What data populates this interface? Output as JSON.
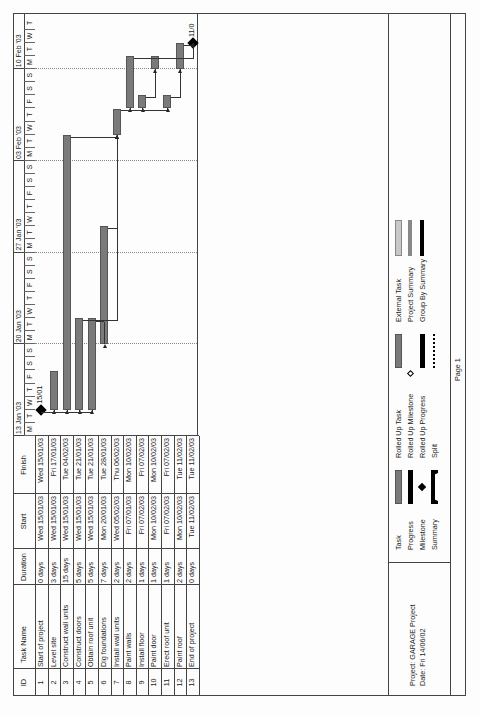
{
  "table": {
    "headers": {
      "id": "ID",
      "task_name": "Task Name",
      "duration": "Duration",
      "start": "Start",
      "finish": "Finish"
    },
    "rows": [
      {
        "id": "1",
        "name": "Start of project",
        "duration": "0 days",
        "start": "Wed 15/01/03",
        "finish": "Wed 15/01/03"
      },
      {
        "id": "2",
        "name": "Level site",
        "duration": "3 days",
        "start": "Wed 15/01/03",
        "finish": "Fri 17/01/03"
      },
      {
        "id": "3",
        "name": "Construct wall units",
        "duration": "15 days",
        "start": "Wed 15/01/03",
        "finish": "Tue 04/02/03"
      },
      {
        "id": "4",
        "name": "Construct doors",
        "duration": "5 days",
        "start": "Wed 15/01/03",
        "finish": "Tue 21/01/03"
      },
      {
        "id": "5",
        "name": "Obtain roof unit",
        "duration": "5 days",
        "start": "Wed 15/01/03",
        "finish": "Tue 21/01/03"
      },
      {
        "id": "6",
        "name": "Dig foundations",
        "duration": "7 days",
        "start": "Mon 20/01/03",
        "finish": "Tue 28/01/03"
      },
      {
        "id": "7",
        "name": "Install wall units",
        "duration": "2 days",
        "start": "Wed 05/02/03",
        "finish": "Thu 06/02/03"
      },
      {
        "id": "8",
        "name": "Paint walls",
        "duration": "2 days",
        "start": "Fri 07/01/03",
        "finish": "Mon 10/02/03"
      },
      {
        "id": "9",
        "name": "Install floor",
        "duration": "1 days",
        "start": "Fri 07/02/03",
        "finish": "Fri 07/02/03"
      },
      {
        "id": "10",
        "name": "Paint door",
        "duration": "1 days",
        "start": "Mon 10/02/03",
        "finish": "Mon 10/02/03"
      },
      {
        "id": "11",
        "name": "Erect roof unit",
        "duration": "1 days",
        "start": "Fri 07/02/03",
        "finish": "Fri 07/02/03"
      },
      {
        "id": "12",
        "name": "Paint roof",
        "duration": "2 days",
        "start": "Mon 10/02/03",
        "finish": "Tue 11/02/03"
      },
      {
        "id": "13",
        "name": "End of project",
        "duration": "0 days",
        "start": "Tue 11/02/03",
        "finish": "Tue 11/02/03"
      }
    ]
  },
  "timeline": {
    "weeks": [
      "13 Jan '03",
      "20 Jan '03",
      "27 Jan '03",
      "03 Feb '03",
      "10 Feb '03"
    ],
    "days": [
      "M",
      "T",
      "W",
      "T",
      "F",
      "S",
      "S",
      "M",
      "T",
      "W",
      "T",
      "F",
      "S",
      "S",
      "M",
      "T",
      "W",
      "T",
      "F",
      "S",
      "S",
      "M",
      "T",
      "W",
      "T",
      "F",
      "S",
      "S",
      "M",
      "T",
      "W",
      "T"
    ],
    "milestone_labels": {
      "start": "15/01",
      "end": "11/0"
    }
  },
  "legend": {
    "project": "Project: GARAGE Project",
    "date": "Date: Fri 14/06/02",
    "items": {
      "task": "Task",
      "progress": "Progress",
      "milestone": "Milestone",
      "summary": "Summary",
      "rolled_up_task": "Rolled Up Task",
      "rolled_up_milestone": "Rolled Up Milestone",
      "rolled_up_progress": "Rolled Up Progress",
      "split": "Split",
      "external_task": "External Task",
      "project_summary": "Project Summary",
      "group_by_summary": "Group By Summary"
    }
  },
  "footer": {
    "page": "Page 1"
  },
  "chart_data": {
    "type": "gantt",
    "title": "GARAGE Project",
    "x_axis": {
      "start": "13 Jan '03",
      "end": "13 Feb '03",
      "unit": "day",
      "week_labels": [
        "13 Jan '03",
        "20 Jan '03",
        "27 Jan '03",
        "03 Feb '03",
        "10 Feb '03"
      ]
    },
    "tasks": [
      {
        "id": 1,
        "name": "Start of project",
        "start_day": 2,
        "end_day": 2,
        "milestone": true,
        "label": "15/01"
      },
      {
        "id": 2,
        "name": "Level site",
        "start_day": 2,
        "end_day": 5
      },
      {
        "id": 3,
        "name": "Construct wall units",
        "start_day": 2,
        "end_day": 23
      },
      {
        "id": 4,
        "name": "Construct doors",
        "start_day": 2,
        "end_day": 9
      },
      {
        "id": 5,
        "name": "Obtain roof unit",
        "start_day": 2,
        "end_day": 9
      },
      {
        "id": 6,
        "name": "Dig foundations",
        "start_day": 7,
        "end_day": 16
      },
      {
        "id": 7,
        "name": "Install wall units",
        "start_day": 23,
        "end_day": 25
      },
      {
        "id": 8,
        "name": "Paint walls",
        "start_day": 25,
        "end_day": 29
      },
      {
        "id": 9,
        "name": "Install floor",
        "start_day": 25,
        "end_day": 26
      },
      {
        "id": 10,
        "name": "Paint door",
        "start_day": 28,
        "end_day": 29
      },
      {
        "id": 11,
        "name": "Erect roof unit",
        "start_day": 25,
        "end_day": 26
      },
      {
        "id": 12,
        "name": "Paint roof",
        "start_day": 28,
        "end_day": 30
      },
      {
        "id": 13,
        "name": "End of project",
        "start_day": 30,
        "end_day": 30,
        "milestone": true,
        "label": "11/0"
      }
    ],
    "grid": "weekly dotted lines"
  }
}
